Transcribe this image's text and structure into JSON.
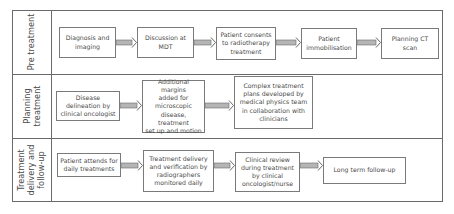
{
  "diagram": {
    "type": "swimlane-flowchart",
    "colors": {
      "border": "#6a6a6a",
      "box_border": "#7a7a7a",
      "arrow_fill": "#b5b5b5",
      "arrow_stroke": "#6a6a6a",
      "text": "#4a4a4a"
    },
    "lanes": [
      {
        "label": "Pre treatment",
        "steps": [
          "Diagnosis and imaging",
          "Discussion at MDT",
          "Patient consents to radiotherapy treatment",
          "Patient immobilisation",
          "Planning CT scan"
        ]
      },
      {
        "label": "Planning treatment",
        "steps": [
          "Disease delineation by clinical oncologist",
          "Additional margins added for microscopic disease, treatment set up and motion",
          "Complex treatment plans developed by medical physics team in collaboration with clinicians"
        ]
      },
      {
        "label": "Treatment delivery and follow-up",
        "steps": [
          "Patient attends for daily treatments",
          "Treatment delivery and verification by radiographers monitored daily",
          "Clinical review during treatment by clinical oncologist/nurse",
          "Long term follow-up"
        ]
      }
    ]
  },
  "lane_labels": {
    "pre": "Pre treatment",
    "planning": "Planning\ntreatment",
    "delivery": "Treatment\ndelivery and\nfollow-up"
  },
  "boxes": {
    "r1b1": "Diagnosis and\nimaging",
    "r1b2": "Discussion at\nMDT",
    "r1b3": "Patient consents\nto radiotherapy\ntreatment",
    "r1b4": "Patient\nimmobilisation",
    "r1b5": "Planning CT\nscan",
    "r2b1": "Disease\ndelineation by\nclinical oncologist",
    "r2b2": "Additional margins\nadded for\nmicroscopic\ndisease, treatment\nset up and motion",
    "r2b3": "Complex treatment\nplans developed by\nmedical physics team\nin collaboration with\nclinicians",
    "r3b1": "Patient attends for\ndaily treatments",
    "r3b2": "Treatment delivery\nand verification by\nradiographers\nmonitored daily",
    "r3b3": "Clinical review\nduring treatment\nby clinical\noncologist/nurse",
    "r3b4": "Long term follow-up"
  }
}
